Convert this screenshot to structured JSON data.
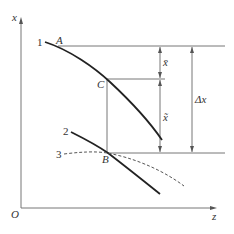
{
  "diagram": {
    "type": "schematic",
    "axes": {
      "y_label": "x",
      "x_label": "z",
      "origin_label": "O"
    },
    "curves": [
      {
        "id": "1",
        "label": "1",
        "style": "solid-thick"
      },
      {
        "id": "2",
        "label": "2",
        "style": "solid-thick"
      },
      {
        "id": "3",
        "label": "3",
        "style": "dashed"
      }
    ],
    "points": [
      {
        "label": "A",
        "on_curve": "1"
      },
      {
        "label": "C",
        "on_curve": "1"
      },
      {
        "label": "B",
        "on_curves": [
          "2",
          "3"
        ]
      }
    ],
    "dimensions": [
      {
        "label": "x̄",
        "from": "A-level",
        "to": "C-level"
      },
      {
        "label": "x̃",
        "from": "C-level",
        "to": "B-level"
      },
      {
        "label": "Δx",
        "from": "A-level",
        "to": "B-level"
      }
    ],
    "colors": {
      "stroke": "#333333",
      "thin_line": "#777777",
      "background": "#ffffff"
    }
  }
}
